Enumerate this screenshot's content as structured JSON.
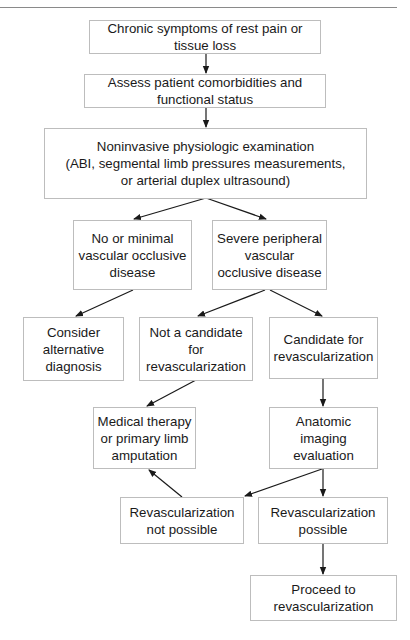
{
  "diagram": {
    "type": "flowchart",
    "nodes": [
      {
        "id": "n1",
        "label": "Chronic symptoms of rest pain or\ntissue loss"
      },
      {
        "id": "n2",
        "label": "Assess patient comorbidities and\nfunctional status"
      },
      {
        "id": "n3",
        "label": "Noninvasive physiologic examination\n(ABI, segmental limb pressures measurements,\nor arterial duplex ultrasound)"
      },
      {
        "id": "n4",
        "label": "No or minimal\nvascular occlusive\ndisease"
      },
      {
        "id": "n5",
        "label": "Severe peripheral\nvascular\nocclusive disease"
      },
      {
        "id": "n6",
        "label": "Consider\nalternative\ndiagnosis"
      },
      {
        "id": "n7",
        "label": "Not a candidate\nfor\nrevascularization"
      },
      {
        "id": "n8",
        "label": "Candidate for\nrevascularization"
      },
      {
        "id": "n9",
        "label": "Medical therapy\nor primary limb\namputation"
      },
      {
        "id": "n10",
        "label": "Anatomic\nimaging\nevaluation"
      },
      {
        "id": "n11",
        "label": "Revascularization\nnot possible"
      },
      {
        "id": "n12",
        "label": "Revascularization\npossible"
      },
      {
        "id": "n13",
        "label": "Proceed to\nrevascularization"
      }
    ],
    "edges": [
      {
        "from": "n1",
        "to": "n2"
      },
      {
        "from": "n2",
        "to": "n3"
      },
      {
        "from": "n3",
        "to": "n4"
      },
      {
        "from": "n3",
        "to": "n5"
      },
      {
        "from": "n4",
        "to": "n6"
      },
      {
        "from": "n5",
        "to": "n7"
      },
      {
        "from": "n5",
        "to": "n8"
      },
      {
        "from": "n7",
        "to": "n9"
      },
      {
        "from": "n8",
        "to": "n10"
      },
      {
        "from": "n10",
        "to": "n11"
      },
      {
        "from": "n10",
        "to": "n12"
      },
      {
        "from": "n11",
        "to": "n9"
      },
      {
        "from": "n12",
        "to": "n13"
      }
    ]
  },
  "colors": {
    "box_border": "#bdbdbd",
    "arrow": "#1a1a1a",
    "text": "#1a1a1a",
    "rule": "#8a8a8a"
  }
}
